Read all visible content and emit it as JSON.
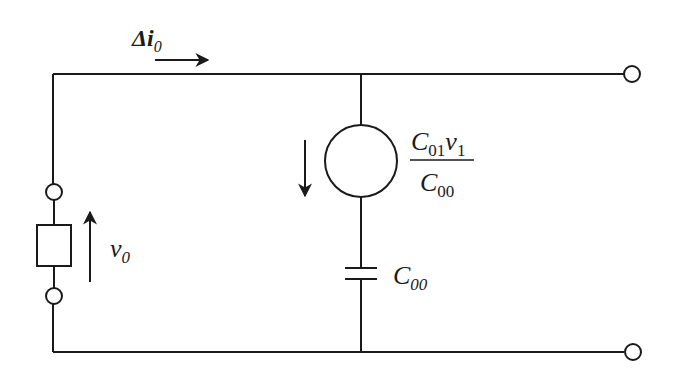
{
  "diagram": {
    "type": "equivalent-circuit",
    "labels": {
      "current": {
        "symbol": "Δi",
        "subscript": "0"
      },
      "voltage": {
        "symbol": "v",
        "subscript": "0"
      },
      "source": {
        "numerator": {
          "c": "C",
          "c_sub": "01",
          "v": "v",
          "v_sub": "1"
        },
        "denominator": {
          "c": "C",
          "c_sub": "00"
        }
      },
      "capacitor": {
        "symbol": "C",
        "subscript": "00"
      }
    },
    "components": [
      "input-port-upper-terminal",
      "input-port-box",
      "input-port-lower-terminal",
      "current-source",
      "capacitor",
      "output-terminal-top",
      "output-terminal-bottom"
    ],
    "colors": {
      "stroke": "#1a1a1a",
      "background": "#ffffff"
    }
  }
}
